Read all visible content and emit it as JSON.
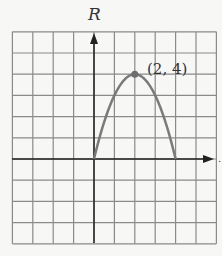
{
  "chart_data": {
    "type": "line",
    "title": "",
    "xlabel": "",
    "ylabel": "R",
    "xlim": [
      -4,
      6
    ],
    "ylim": [
      -4,
      6
    ],
    "grid": true,
    "grid_step": 1,
    "series": [
      {
        "name": "R",
        "function": "R = 4t - t^2",
        "x": [
          0,
          0.5,
          1,
          1.5,
          2,
          2.5,
          3,
          3.5,
          4
        ],
        "values": [
          0,
          1.75,
          3,
          3.75,
          4,
          3.75,
          3,
          1.75,
          0
        ]
      }
    ],
    "annotations": [
      {
        "text": "(2, 4)",
        "x": 2,
        "y": 4,
        "marker": true
      }
    ]
  },
  "labels": {
    "y_axis": "R",
    "vertex": "(2, 4)"
  },
  "colors": {
    "grid": "#8a8a8a",
    "axis": "#222222",
    "curve": "#7a7a7a",
    "background": "#f7f7f6"
  }
}
